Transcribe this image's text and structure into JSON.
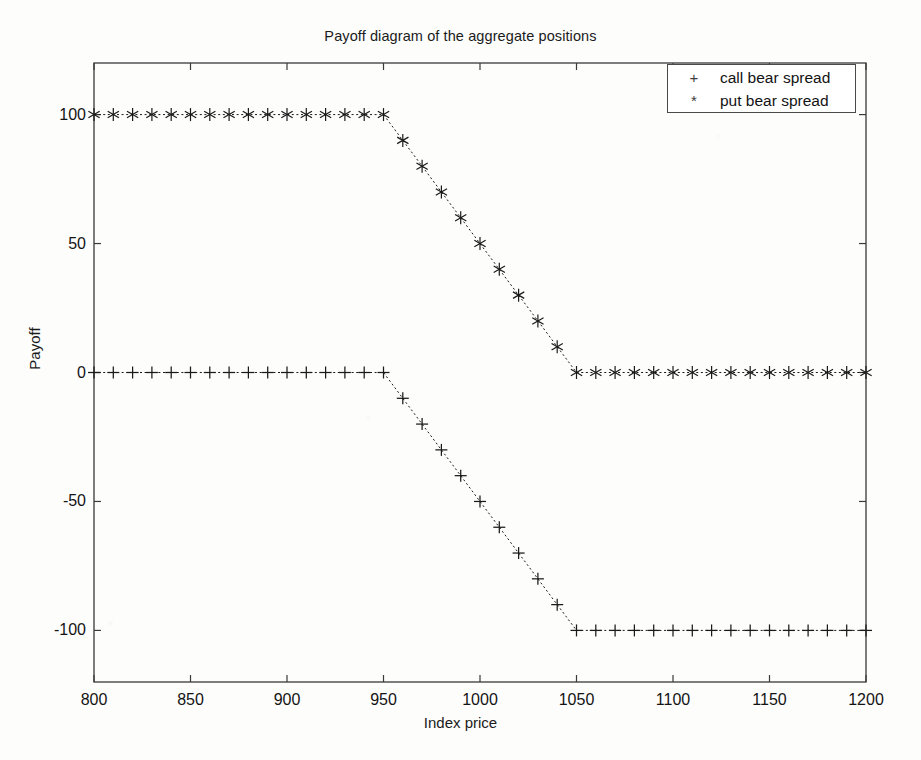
{
  "chart_data": {
    "type": "line",
    "title": "Payoff diagram of the aggregate positions",
    "xlabel": "Index price",
    "ylabel": "Payoff",
    "xlim": [
      800,
      1200
    ],
    "ylim": [
      -120,
      120
    ],
    "xticks": [
      800,
      850,
      900,
      950,
      1000,
      1050,
      1100,
      1150,
      1200
    ],
    "yticks": [
      100,
      50,
      0,
      -50,
      -100
    ],
    "xtick_labels": [
      "800",
      "850",
      "900",
      "950",
      "1000",
      "1050",
      "1100",
      "1150",
      "1200"
    ],
    "ytick_labels": [
      "100",
      "50",
      "0",
      "-50",
      "-100"
    ],
    "grid": false,
    "legend_position": "top-right",
    "x": [
      800,
      810,
      820,
      830,
      840,
      850,
      860,
      870,
      880,
      890,
      900,
      910,
      920,
      930,
      940,
      950,
      960,
      970,
      980,
      990,
      1000,
      1010,
      1020,
      1030,
      1040,
      1050,
      1060,
      1070,
      1080,
      1090,
      1100,
      1110,
      1120,
      1130,
      1140,
      1150,
      1160,
      1170,
      1180,
      1190,
      1200
    ],
    "series": [
      {
        "name": "call bear spread",
        "marker": "+",
        "color": "#1a1a1a",
        "linestyle": "dotted",
        "values": [
          0,
          0,
          0,
          0,
          0,
          0,
          0,
          0,
          0,
          0,
          0,
          0,
          0,
          0,
          0,
          0,
          -10,
          -20,
          -30,
          -40,
          -50,
          -60,
          -70,
          -80,
          -90,
          -100,
          -100,
          -100,
          -100,
          -100,
          -100,
          -100,
          -100,
          -100,
          -100,
          -100,
          -100,
          -100,
          -100,
          -100,
          -100
        ]
      },
      {
        "name": "put bear spread",
        "marker": "*",
        "color": "#1a1a1a",
        "linestyle": "dotted",
        "values": [
          100,
          100,
          100,
          100,
          100,
          100,
          100,
          100,
          100,
          100,
          100,
          100,
          100,
          100,
          100,
          100,
          90,
          80,
          70,
          60,
          50,
          40,
          30,
          20,
          10,
          0,
          0,
          0,
          0,
          0,
          0,
          0,
          0,
          0,
          0,
          0,
          0,
          0,
          0,
          0,
          0
        ]
      }
    ]
  },
  "legend": {
    "entries": [
      {
        "marker": "+",
        "label": "call bear spread"
      },
      {
        "marker": "*",
        "label": "put bear spread"
      }
    ]
  },
  "colors": {
    "axis": "#3a3a3a",
    "data": "#1a1a1a",
    "background": "#fdfdfc"
  }
}
